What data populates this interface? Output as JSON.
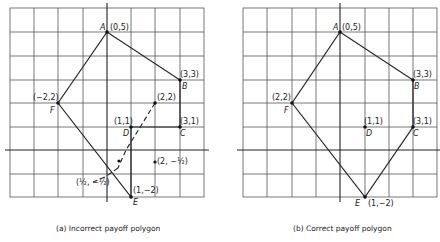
{
  "panels": [
    {
      "id": "a",
      "caption": "(a) Incorrect payoff polygon",
      "origin_px": [
        107,
        150
      ],
      "unit_px": [
        24.2,
        23.6
      ],
      "grid_x_lines": [
        10,
        34,
        58,
        83,
        107,
        131,
        155,
        180,
        204
      ],
      "grid_y_lines": [
        8,
        32,
        56,
        80,
        103,
        127,
        150,
        174,
        197
      ],
      "grid_box": [
        10,
        8,
        204,
        197
      ],
      "vertices": [
        {
          "name": "A",
          "coord_label": "(0,5)",
          "x": 0,
          "y": 5
        },
        {
          "name": "B",
          "coord_label": "(3,3)",
          "x": 3,
          "y": 3
        },
        {
          "name": "C",
          "coord_label": "(3,1)",
          "x": 3,
          "y": 1
        },
        {
          "name": "D",
          "coord_label": "(1,1)",
          "x": 1,
          "y": 1
        },
        {
          "name": "E",
          "coord_label": "(1,−2)",
          "x": 1,
          "y": -2
        },
        {
          "name": "F",
          "coord_label": "(−2,2)",
          "x": -2,
          "y": 2
        }
      ],
      "extra_points": [
        {
          "label": "(2,2)",
          "x": 2,
          "y": 2
        },
        {
          "label": "(2, −½)",
          "x": 2,
          "y": -0.5
        },
        {
          "label": "(½, −½)",
          "x": 0.5,
          "y": -0.5
        }
      ]
    },
    {
      "id": "b",
      "caption": "(b) Correct payoff polygon",
      "origin_px": [
        340,
        150
      ],
      "unit_px": [
        24.2,
        23.6
      ],
      "vertices": [
        {
          "name": "A",
          "coord_label": "(0,5)",
          "x": 0,
          "y": 5
        },
        {
          "name": "B",
          "coord_label": "(3,3)",
          "x": 3,
          "y": 3
        },
        {
          "name": "C",
          "coord_label": "(3,1)",
          "x": 3,
          "y": 1
        },
        {
          "name": "D",
          "coord_label": "(1,1)",
          "x": 1,
          "y": 1
        },
        {
          "name": "E",
          "coord_label": "(1,−2)",
          "x": 1,
          "y": -2
        },
        {
          "name": "F",
          "coord_label": "(2,2)",
          "x": -2,
          "y": 2
        }
      ]
    }
  ],
  "labels": {
    "a_A": "A",
    "a_A_c": "(0,5)",
    "a_B": "B",
    "a_B_c": "(3,3)",
    "a_C": "C",
    "a_C_c": "(3,1)",
    "a_D": "D",
    "a_D_c": "(1,1)",
    "a_E": "E",
    "a_E_c": "(1,−2)",
    "a_F": "F",
    "a_F_c": "(−2,2)",
    "a_p22": "(2,2)",
    "a_p2h": "(2, −½)",
    "a_phh": "(½, −½)",
    "b_A": "A",
    "b_A_c": "(0,5)",
    "b_B": "B",
    "b_B_c": "(3,3)",
    "b_C": "C",
    "b_C_c": "(3,1)",
    "b_D": "D",
    "b_D_c": "(1,1)",
    "b_E": "E",
    "b_E_c": "(1,−2)",
    "b_F": "F",
    "b_F_c": "(2,2)",
    "cap_a": "(a) Incorrect payoff polygon",
    "cap_b": "(b) Correct payoff polygon"
  }
}
